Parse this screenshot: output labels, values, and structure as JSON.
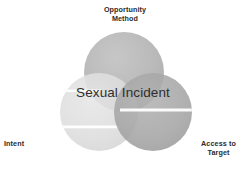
{
  "diagram": {
    "type": "venn-3-circle",
    "title": "Sexual Incident",
    "center_label": "Sexual Incident",
    "background_color": "#ffffff",
    "text_color": "#2b2b2b",
    "center_text_color": "#2e2e2e",
    "labels": {
      "top": "Opportunity\nMethod",
      "bottom_left": "Intent",
      "bottom_right": "Access to\nTarget"
    },
    "circles": [
      {
        "name": "opportunity-method",
        "label": "Opportunity Method",
        "position": "top",
        "cx": 124,
        "cy": 72,
        "r": 40,
        "fill": "#b0b0b0",
        "opacity": 0.85
      },
      {
        "name": "intent",
        "label": "Intent",
        "position": "bottom-left",
        "cx": 99,
        "cy": 112,
        "r": 39,
        "fill": "#dcdcdc",
        "opacity": 0.9
      },
      {
        "name": "access-to-target",
        "label": "Access to Target",
        "position": "bottom-right",
        "cx": 153,
        "cy": 112,
        "r": 39,
        "fill": "#a3a3a3",
        "opacity": 0.85
      }
    ],
    "highlights": [
      {
        "name": "intent-highlight-upper",
        "x": 56,
        "y": 90,
        "width": 44,
        "height": 3,
        "color": "#ffffff"
      },
      {
        "name": "intent-highlight-lower",
        "x": 62,
        "y": 126,
        "width": 58,
        "height": 3,
        "color": "#ffffff"
      },
      {
        "name": "access-highlight",
        "x": 122,
        "y": 109,
        "width": 68,
        "height": 3,
        "color": "#ffffff"
      }
    ]
  }
}
